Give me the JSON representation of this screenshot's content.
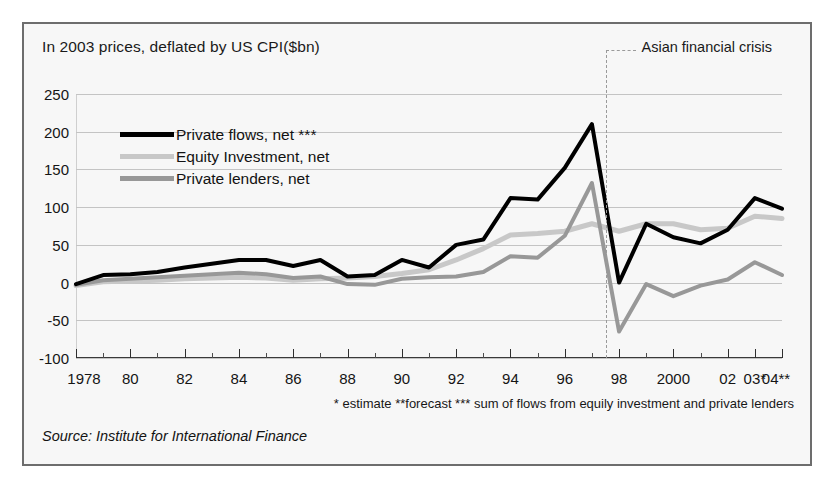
{
  "figure": {
    "title": "In 2003 prices, deflated by US CPI($bn)",
    "source": "Source: Institute for International Finance",
    "footnote": "* estimate **forecast *** sum of flows from equily investment and private lenders",
    "annotation": "Asian financial crisis",
    "panel_background": "#f7f7f7",
    "border_color": "#6d6d6d",
    "gridline_color": "#c4c4c4"
  },
  "chart_data": {
    "type": "line",
    "title": "In 2003 prices, deflated by US CPI($bn)",
    "subtitle": "",
    "xlabel": "",
    "ylabel": "$bn (2003 prices)",
    "ylim": [
      -100,
      250
    ],
    "yticks": [
      250,
      200,
      150,
      100,
      50,
      0,
      -50,
      -100
    ],
    "ytick_labels": [
      "250",
      "200",
      "150",
      "100",
      "50",
      "0",
      "-50",
      "-100"
    ],
    "xlim": [
      1978,
      2004
    ],
    "x": [
      1978,
      1979,
      1980,
      1981,
      1982,
      1983,
      1984,
      1985,
      1986,
      1987,
      1988,
      1989,
      1990,
      1991,
      1992,
      1993,
      1994,
      1995,
      1996,
      1997,
      1998,
      1999,
      2000,
      2001,
      2002,
      2003,
      2004
    ],
    "xtick_labels": [
      "1978",
      "80",
      "82",
      "84",
      "86",
      "88",
      "90",
      "92",
      "94",
      "96",
      "98",
      "2000",
      "02",
      "03*",
      "04**"
    ],
    "xtick_values": [
      1978,
      1980,
      1982,
      1984,
      1986,
      1988,
      1990,
      1992,
      1994,
      1996,
      1998,
      2000,
      2002,
      2003,
      2004
    ],
    "grid": true,
    "legend_position": "upper-left",
    "annotations": [
      {
        "label": "Asian financial crisis",
        "x": 1997.5,
        "style": "dashed-vertical"
      }
    ],
    "series": [
      {
        "name": "Private flows, net ***",
        "color": "#000000",
        "width": 4,
        "values": [
          -2,
          10,
          11,
          14,
          20,
          25,
          30,
          30,
          22,
          30,
          8,
          10,
          30,
          20,
          50,
          57,
          112,
          110,
          152,
          210,
          0,
          78,
          60,
          52,
          70,
          112,
          98
        ]
      },
      {
        "name": "Equity Investment, net",
        "color": "#c8c8c8",
        "width": 5,
        "values": [
          -4,
          1,
          2,
          3,
          5,
          6,
          7,
          6,
          3,
          5,
          6,
          8,
          12,
          17,
          30,
          45,
          63,
          65,
          68,
          78,
          68,
          78,
          78,
          70,
          72,
          88,
          85
        ]
      },
      {
        "name": "Private lenders, net",
        "color": "#989898",
        "width": 4,
        "values": [
          -3,
          3,
          5,
          7,
          9,
          11,
          13,
          11,
          6,
          8,
          -2,
          -3,
          5,
          7,
          8,
          14,
          35,
          33,
          62,
          132,
          -65,
          -2,
          -18,
          -4,
          4,
          27,
          10
        ]
      }
    ]
  },
  "legend": {
    "items": [
      {
        "label": "Private flows, net ***",
        "color": "#000000",
        "thickness": 5
      },
      {
        "label": "Equity Investment, net",
        "color": "#c8c8c8",
        "thickness": 5
      },
      {
        "label": "Private lenders, net",
        "color": "#989898",
        "thickness": 5
      }
    ]
  }
}
